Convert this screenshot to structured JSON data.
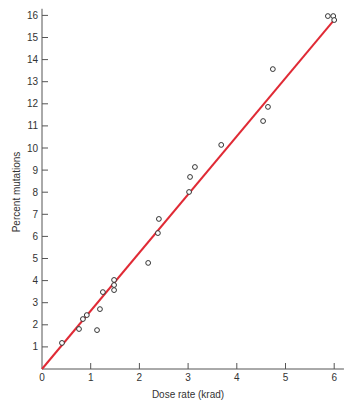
{
  "chart_data": {
    "type": "scatter",
    "title": "",
    "xlabel": "Dose rate (krad)",
    "ylabel": "Percent mutations",
    "xlim": [
      0,
      6.2
    ],
    "ylim": [
      0,
      16.3
    ],
    "x_ticks": [
      0,
      1,
      2,
      3,
      4,
      5,
      6
    ],
    "y_ticks": [
      1,
      2,
      3,
      4,
      5,
      6,
      7,
      8,
      9,
      10,
      11,
      12,
      13,
      14,
      15,
      16
    ],
    "y_zero_label": "0",
    "grid": false,
    "legend": null,
    "values_note": "Point coordinates are estimated from marker pixel positions; the figure does not label individual points. Approximate precision: ±0.05 krad, ±0.1 percentage points.",
    "series": [
      {
        "name": "observed",
        "marker": "open-circle",
        "color": "#333333",
        "x": [
          0.41,
          0.76,
          0.84,
          0.92,
          1.13,
          1.19,
          1.25,
          1.48,
          1.48,
          1.48,
          2.18,
          2.38,
          2.4,
          3.02,
          3.04,
          3.14,
          3.68,
          4.54,
          4.64,
          4.74,
          5.87,
          5.98,
          6.0
        ],
        "y": [
          1.18,
          1.81,
          2.26,
          2.44,
          1.76,
          2.71,
          3.48,
          3.57,
          3.8,
          4.03,
          4.8,
          6.15,
          6.79,
          8.01,
          8.69,
          9.14,
          10.14,
          11.22,
          11.86,
          13.57,
          15.97,
          15.97,
          15.79
        ]
      }
    ],
    "fit_line": {
      "name": "linear fit",
      "color": "#e02a35",
      "x": [
        0,
        6
      ],
      "y": [
        0,
        15.8
      ]
    }
  }
}
